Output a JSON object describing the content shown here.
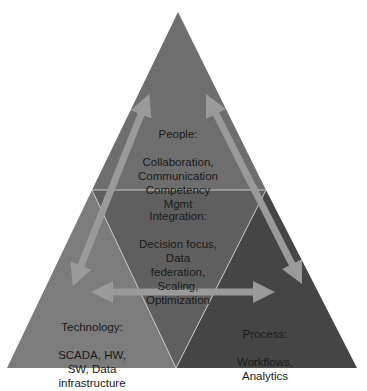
{
  "diagram": {
    "type": "pyramid",
    "colors": {
      "background": "#ffffff",
      "people": "#6e6e6e",
      "integration": "#5f5f5f",
      "technology": "#7c7c7c",
      "process": "#454545",
      "arrow": "#9a9a9a",
      "divider": "#c8c8c8"
    },
    "sections": {
      "people": {
        "title": "People:",
        "body": "Collaboration,\nCommunication\nCompetency\nMgmt"
      },
      "integration": {
        "title": "Integration:",
        "body": "Decision focus,\nData\nfederation,\nScaling,\nOptimization"
      },
      "technology": {
        "title": "Technology:",
        "body": "SCADA, HW,\nSW, Data\ninfrastructure"
      },
      "process": {
        "title": "Process:",
        "body": "Workflows,\nAnalytics"
      }
    },
    "arrows": [
      {
        "from": "people",
        "to": "technology",
        "style": "double-headed"
      },
      {
        "from": "people",
        "to": "process",
        "style": "double-headed"
      },
      {
        "from": "technology",
        "to": "process",
        "style": "double-headed"
      }
    ]
  }
}
